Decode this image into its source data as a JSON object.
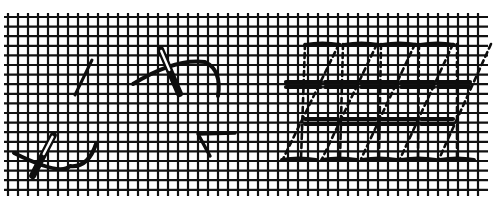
{
  "figure": {
    "description": "Needlework stitch diagram on canvas mesh: step-by-step needle placement (left) and finished interlaced stitch pattern (right)",
    "colors": {
      "background": "#ffffff",
      "ink": "#0d0d0d",
      "mesh": "#111111"
    }
  },
  "grid": {
    "x_start": 8,
    "x_end": 484,
    "x_step": 10,
    "y_start": 17,
    "y_end": 192,
    "y_step": 9.6
  },
  "steps_panel": {
    "elements": [
      {
        "name": "step1-short-stitch",
        "type": "stitch",
        "path": "M75 95 L92 60",
        "width": 3
      },
      {
        "name": "step2-curved-thread",
        "type": "thread",
        "path": "M133 84 Q175 58 205 62 Q222 70 218 96",
        "width": 4
      },
      {
        "name": "step2-needle",
        "type": "needle",
        "x1": 160,
        "y1": 48,
        "x2": 180,
        "y2": 95,
        "w": 7
      },
      {
        "name": "step3-curved-thread",
        "type": "thread",
        "path": "M14 153 Q60 176 70 166 Q88 168 96 144",
        "width": 4
      },
      {
        "name": "step3-needle",
        "type": "needle",
        "x1": 54,
        "y1": 134,
        "x2": 32,
        "y2": 177,
        "w": 7
      },
      {
        "name": "step4-corner-stitch",
        "type": "stitch",
        "path": "M210 156 L198 134 L235 133",
        "width": 3.4
      }
    ]
  },
  "pattern_panel": {
    "columns": [
      {
        "x_top": 305,
        "x_bottom": 283
      },
      {
        "x_top": 343,
        "x_bottom": 322
      },
      {
        "x_top": 381,
        "x_bottom": 361
      },
      {
        "x_top": 419,
        "x_bottom": 400
      },
      {
        "x_top": 457,
        "x_bottom": 439
      }
    ],
    "top_bars": {
      "y": 44,
      "segments": [
        [
          305,
          340
        ],
        [
          344,
          379
        ],
        [
          382,
          417
        ],
        [
          420,
          454
        ]
      ]
    },
    "upper_double_bar": {
      "y1": 82,
      "y2": 87,
      "x_start": 284,
      "x_end": 472,
      "breaks": [
        323,
        359,
        399,
        436
      ]
    },
    "lower_double_bar": {
      "y1": 119,
      "y2": 124,
      "x_start": 303,
      "x_end": 455,
      "breaks": [
        340,
        378,
        419
      ]
    },
    "bottom_bars": {
      "y": 159,
      "segments": [
        [
          282,
          316
        ],
        [
          322,
          357
        ],
        [
          362,
          397
        ],
        [
          401,
          436
        ],
        [
          440,
          474
        ]
      ]
    }
  }
}
